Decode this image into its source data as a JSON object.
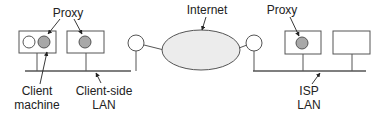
{
  "diagram": {
    "labels": {
      "proxy_left": "Proxy",
      "internet": "Internet",
      "proxy_right": "Proxy",
      "client_line1": "Client",
      "client_line2": "machine",
      "clientlan_line1": "Client-side",
      "clientlan_line2": "LAN",
      "isp_line1": "ISP",
      "isp_line2": "LAN"
    },
    "colors": {
      "stroke": "#555555",
      "proxy_fill": "#a8a8a8",
      "cloud_fill": "#ececec",
      "text": "#222222"
    },
    "nodes": [
      {
        "id": "client-machine",
        "type": "box",
        "contains": [
          "client-process",
          "proxy"
        ]
      },
      {
        "id": "client-side-proxy-host",
        "type": "box",
        "contains": [
          "proxy"
        ]
      },
      {
        "id": "left-router",
        "type": "router"
      },
      {
        "id": "internet",
        "type": "cloud"
      },
      {
        "id": "right-router",
        "type": "router"
      },
      {
        "id": "isp-proxy-host",
        "type": "box",
        "contains": [
          "proxy"
        ]
      },
      {
        "id": "isp-host",
        "type": "box",
        "contains": []
      }
    ]
  }
}
